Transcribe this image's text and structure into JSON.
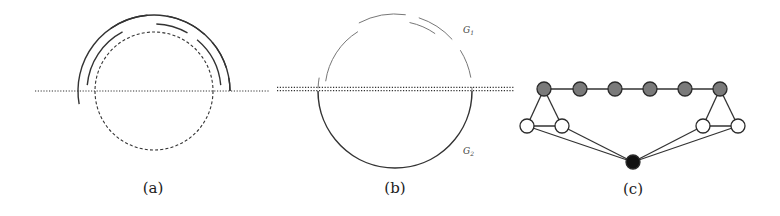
{
  "figure": {
    "width": 780,
    "height": 216,
    "colors": {
      "background": "#ffffff",
      "ink": "#333333",
      "light_ink": "#777777",
      "gray_node": "#7a7a7a",
      "white_node": "#ffffff",
      "black_node": "#111111"
    },
    "panels": [
      {
        "id": "a",
        "caption": "(a)",
        "caption_pos": [
          153,
          193
        ],
        "axis_line": {
          "x1": 35,
          "x2": 270,
          "y": 91,
          "style": "dotted",
          "double": false
        },
        "dashed_circle": {
          "cx": 154,
          "cy": 91,
          "r": 59
        },
        "arcs": [
          {
            "cx": 154,
            "cy": 91,
            "r": 76,
            "start": 170,
            "end": 360,
            "note": "outer ring lower half incl. left tip"
          },
          {
            "cx": 154,
            "cy": 91,
            "r": 76,
            "start": -10,
            "end": 0
          },
          {
            "cx": 154,
            "cy": 91,
            "r": 76,
            "start": -40,
            "end": -18
          },
          {
            "cx": 154,
            "cy": 91,
            "r": 76,
            "start": -80,
            "end": -48
          },
          {
            "cx": 154,
            "cy": 91,
            "r": 76,
            "start": -125,
            "end": -95
          },
          {
            "cx": 154,
            "cy": 91,
            "r": 67,
            "start": -175,
            "end": -118
          },
          {
            "cx": 154,
            "cy": 91,
            "r": 67,
            "start": -88,
            "end": -60
          },
          {
            "cx": 154,
            "cy": 91,
            "r": 67,
            "start": -50,
            "end": -5
          }
        ]
      },
      {
        "id": "b",
        "caption": "(b)",
        "caption_pos": [
          395,
          193
        ],
        "axis_line": {
          "x1": 277,
          "x2": 515,
          "y": 89,
          "style": "dotted",
          "double": true
        },
        "arcs": [
          {
            "cx": 395,
            "cy": 91,
            "r": 77,
            "start": 0,
            "end": 180,
            "weight": "heavy"
          },
          {
            "cx": 395,
            "cy": 91,
            "r": 77,
            "start": -178,
            "end": -170,
            "weight": "light"
          },
          {
            "cx": 395,
            "cy": 91,
            "r": 77,
            "start": -3,
            "end": 0,
            "weight": "light"
          },
          {
            "cx": 395,
            "cy": 91,
            "r": 77,
            "start": -32,
            "end": -10,
            "weight": "light"
          },
          {
            "cx": 395,
            "cy": 91,
            "r": 77,
            "start": -72,
            "end": -42,
            "weight": "light"
          },
          {
            "cx": 395,
            "cy": 91,
            "r": 77,
            "start": -118,
            "end": -82,
            "weight": "light"
          },
          {
            "cx": 395,
            "cy": 91,
            "r": 70,
            "start": -172,
            "end": -122,
            "weight": "light"
          },
          {
            "cx": 395,
            "cy": 91,
            "r": 70,
            "start": -78,
            "end": -55,
            "weight": "light"
          }
        ],
        "labels": [
          {
            "text": "G",
            "sub": "1",
            "x": 463,
            "y": 33
          },
          {
            "text": "G",
            "sub": "2",
            "x": 463,
            "y": 154
          }
        ]
      },
      {
        "id": "c",
        "caption": "(c)",
        "caption_pos": [
          633,
          194
        ],
        "node_radius": 7,
        "nodes": [
          {
            "id": "g1",
            "x": 544,
            "y": 89,
            "type": "gray"
          },
          {
            "id": "g2",
            "x": 580,
            "y": 89,
            "type": "gray"
          },
          {
            "id": "g3",
            "x": 615,
            "y": 89,
            "type": "gray"
          },
          {
            "id": "g4",
            "x": 650,
            "y": 89,
            "type": "gray"
          },
          {
            "id": "g5",
            "x": 685,
            "y": 89,
            "type": "gray"
          },
          {
            "id": "g6",
            "x": 720,
            "y": 89,
            "type": "gray"
          },
          {
            "id": "w1",
            "x": 527,
            "y": 126,
            "type": "white"
          },
          {
            "id": "w2",
            "x": 562,
            "y": 126,
            "type": "white"
          },
          {
            "id": "w3",
            "x": 703,
            "y": 126,
            "type": "white"
          },
          {
            "id": "w4",
            "x": 738,
            "y": 126,
            "type": "white"
          },
          {
            "id": "b1",
            "x": 633,
            "y": 162,
            "type": "black"
          }
        ],
        "edges": [
          [
            "g1",
            "g2"
          ],
          [
            "g2",
            "g3"
          ],
          [
            "g3",
            "g4"
          ],
          [
            "g4",
            "g5"
          ],
          [
            "g5",
            "g6"
          ],
          [
            "g1",
            "w1"
          ],
          [
            "g1",
            "w2"
          ],
          [
            "w1",
            "w2"
          ],
          [
            "g6",
            "w3"
          ],
          [
            "g6",
            "w4"
          ],
          [
            "w3",
            "w4"
          ],
          [
            "w1",
            "b1"
          ],
          [
            "w2",
            "b1"
          ],
          [
            "w3",
            "b1"
          ],
          [
            "w4",
            "b1"
          ]
        ]
      }
    ]
  }
}
